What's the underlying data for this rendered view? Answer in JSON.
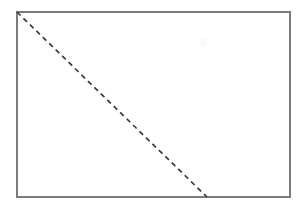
{
  "figure": {
    "canvas": {
      "width": 303,
      "height": 209,
      "background_color": "#ffffff"
    },
    "shapes": {
      "rectangle": {
        "name": "outer rectangle",
        "x": 17,
        "y": 12,
        "width": 273,
        "height": 185,
        "stroke_color": "#7c7c7c",
        "stroke_width": 1.4,
        "fill": "none"
      },
      "diagonal": {
        "name": "dashed diagonal line",
        "x1": 17,
        "y1": 12,
        "x2": 207,
        "y2": 197,
        "stroke_color": "#3a3a3a",
        "stroke_width": 1.7,
        "dash_length": 5,
        "gap_length": 4,
        "style": "dashed"
      },
      "artifact": {
        "name": "faint scan artifact",
        "cx": 203,
        "cy": 42,
        "r": 4,
        "color": "#fafafa"
      }
    }
  }
}
